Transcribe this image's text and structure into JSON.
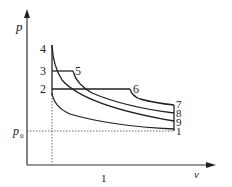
{
  "diagram": {
    "type": "p-v diagram",
    "axes": {
      "y_label": "p",
      "x_label": "v",
      "p0_label": "p",
      "p0_subscript": "0",
      "x_tick_label": "1"
    },
    "points": [
      {
        "id": "1",
        "label": "1"
      },
      {
        "id": "2",
        "label": "2"
      },
      {
        "id": "3",
        "label": "3"
      },
      {
        "id": "4",
        "label": "4"
      },
      {
        "id": "5",
        "label": "5"
      },
      {
        "id": "6",
        "label": "6"
      },
      {
        "id": "7",
        "label": "7"
      },
      {
        "id": "8",
        "label": "8"
      },
      {
        "id": "9",
        "label": "9"
      }
    ],
    "colors": {
      "line": "#222222",
      "background": "#ffffff"
    }
  }
}
